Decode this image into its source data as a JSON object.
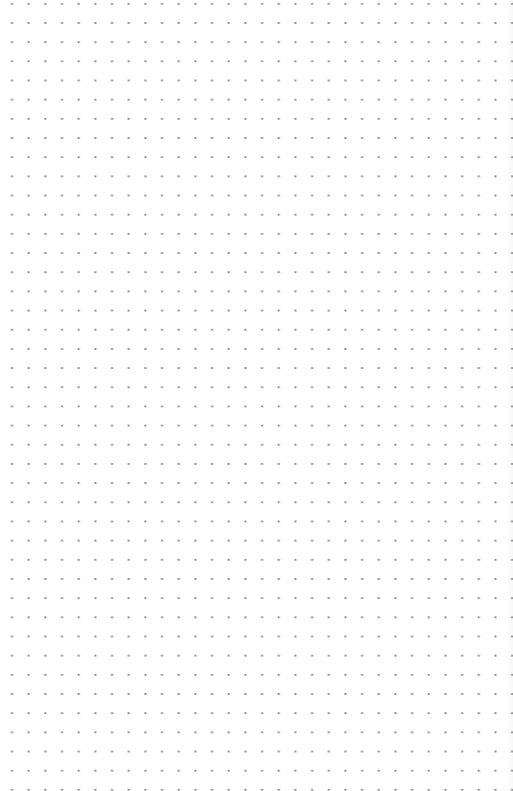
{
  "canvas": {
    "type": "dot-grid",
    "background_color": "#ffffff",
    "dot_color": "#8a8a8a",
    "columns": 30,
    "rows": 40,
    "spacing_x": 16.68,
    "spacing_y": 19.18
  }
}
